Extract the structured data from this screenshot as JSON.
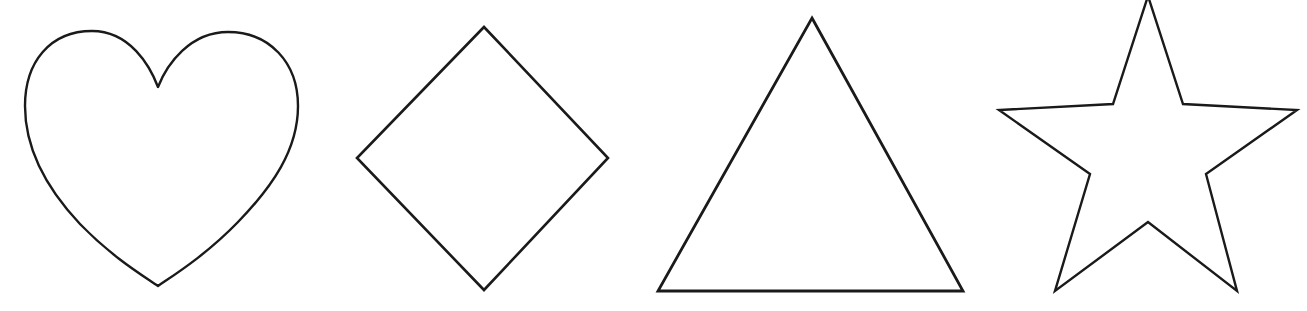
{
  "canvas": {
    "width": 1307,
    "height": 311,
    "background_color": "#ffffff",
    "stroke_color": "#1a1a1a",
    "description": "Four black outline shapes on a plain white background, arranged left to right"
  },
  "shapes": [
    {
      "id": "heart",
      "name": "heart",
      "label": "Heart",
      "index": 1,
      "order": "first",
      "position": "left",
      "fill": "none",
      "stroke_color": "#1a1a1a",
      "stroke_width": 2.4,
      "bounds": {
        "x": 25,
        "y": 31,
        "width": 273,
        "height": 255
      },
      "center": {
        "x": 160,
        "y": 158
      },
      "key_points": {
        "cusp": {
          "x": 158,
          "y": 87
        },
        "bottom_tip": {
          "x": 158,
          "y": 286
        },
        "left_extreme": {
          "x": 25,
          "y": 110
        },
        "right_extreme": {
          "x": 298,
          "y": 106
        },
        "left_lobe_peak": {
          "x": 92,
          "y": 31
        },
        "right_lobe_peak": {
          "x": 225,
          "y": 32
        }
      },
      "path": "M 158 87 C 150 66 130 31 92 31 C 50 31 25 62 25 106 C 25 150 48 190 80 224 C 112 257 142 275 158 286 C 174 275 206 255 238 222 C 272 187 298 150 298 106 C 298 62 269 32 228 32 C 190 32 167 64 158 87 Z"
    },
    {
      "id": "diamond",
      "name": "diamond",
      "label": "Diamond",
      "index": 2,
      "order": "second",
      "position": "center-left",
      "fill": "none",
      "stroke_color": "#1a1a1a",
      "stroke_width": 2.6,
      "bounds": {
        "x": 357,
        "y": 27,
        "width": 251,
        "height": 263
      },
      "center": {
        "x": 483,
        "y": 158
      },
      "vertices": [
        {
          "x": 484,
          "y": 27
        },
        {
          "x": 608,
          "y": 158
        },
        {
          "x": 484,
          "y": 290
        },
        {
          "x": 357,
          "y": 158
        }
      ],
      "points_attr": "484,27 608,158 484,290 357,158"
    },
    {
      "id": "triangle",
      "name": "triangle",
      "label": "Triangle",
      "index": 3,
      "order": "third",
      "position": "center-right",
      "fill": "none",
      "stroke_color": "#1a1a1a",
      "stroke_width": 2.8,
      "bounds": {
        "x": 658,
        "y": 18,
        "width": 305,
        "height": 273
      },
      "center": {
        "x": 811,
        "y": 200
      },
      "vertices": [
        {
          "x": 812,
          "y": 18
        },
        {
          "x": 963,
          "y": 291
        },
        {
          "x": 658,
          "y": 291
        }
      ],
      "points_attr": "812,18 963,291 658,291"
    },
    {
      "id": "star",
      "name": "star",
      "label": "Star",
      "index": 4,
      "order": "fourth",
      "position": "right",
      "points_count": 5,
      "fill": "none",
      "stroke_color": "#1a1a1a",
      "stroke_width": 2.4,
      "clipped_at_top": true,
      "bounds": {
        "x": 999,
        "y": 0,
        "width": 298,
        "height": 291
      },
      "center": {
        "x": 1148,
        "y": 152
      },
      "vertices": [
        {
          "x": 1148,
          "y": -4
        },
        {
          "x": 1183,
          "y": 104
        },
        {
          "x": 1297,
          "y": 110
        },
        {
          "x": 1206,
          "y": 174
        },
        {
          "x": 1237,
          "y": 291
        },
        {
          "x": 1148,
          "y": 222
        },
        {
          "x": 1055,
          "y": 291
        },
        {
          "x": 1090,
          "y": 174
        },
        {
          "x": 999,
          "y": 110
        },
        {
          "x": 1113,
          "y": 104
        }
      ],
      "points_attr": "1148,-4 1183,104 1297,110 1206,174 1237,291 1148,222 1055,291 1090,174 999,110 1113,104"
    }
  ]
}
